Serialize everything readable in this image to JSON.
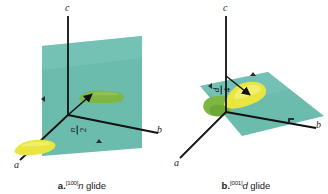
{
  "figure": {
    "background_color": "#ffffff"
  },
  "colors": {
    "plane_teal": "#6cbcae",
    "plane_teal_light": "#7fc8bb",
    "plane_teal_dark": "#59ab9d",
    "blob_yellow": "#e9e641",
    "blob_yellow_light": "#f2f06a",
    "blob_green": "#7fb541",
    "blob_green_dark": "#6aa235",
    "axis_line": "#111111",
    "text": "#1a1a1a"
  },
  "panels": [
    {
      "id": "panel-a",
      "caption": {
        "letter": "a.",
        "direction": "[100]",
        "glide_symbol": "n",
        "word": "glide",
        "full_text": "a. [100]n glide"
      },
      "axes": [
        {
          "name": "c-axis",
          "label": "c"
        },
        {
          "name": "b-axis",
          "label": "b"
        },
        {
          "name": "a-axis",
          "label": "a"
        }
      ],
      "translation_vector": {
        "name": "glide-translation-vector",
        "numerator": "n",
        "denominator": "2",
        "label": "n/2"
      },
      "plane": {
        "name": "glide-plane-vertical",
        "orientation": "vertical, perpendicular to a"
      },
      "motifs": [
        {
          "name": "motif-yellow",
          "color_key": "blob_yellow",
          "position": "origin, on a-axis"
        },
        {
          "name": "motif-green",
          "color_key": "blob_green",
          "position": "on vertical plane"
        }
      ]
    },
    {
      "id": "panel-b",
      "caption": {
        "letter": "b.",
        "direction": "[001]",
        "glide_symbol": "d",
        "word": "glide",
        "full_text": "b. [001]d glide"
      },
      "axes": [
        {
          "name": "c-axis",
          "label": "c"
        },
        {
          "name": "b-axis",
          "label": "b"
        },
        {
          "name": "a-axis",
          "label": "a"
        }
      ],
      "translation_vector": {
        "name": "glide-translation-vector",
        "numerator": "d",
        "denominator": "4",
        "label": "d/4"
      },
      "plane": {
        "name": "glide-plane-horizontal",
        "orientation": "horizontal, perpendicular to c"
      },
      "motifs": [
        {
          "name": "motif-yellow",
          "color_key": "blob_yellow",
          "position": "above plane"
        },
        {
          "name": "motif-green",
          "color_key": "blob_green",
          "position": "below plane"
        }
      ]
    }
  ]
}
